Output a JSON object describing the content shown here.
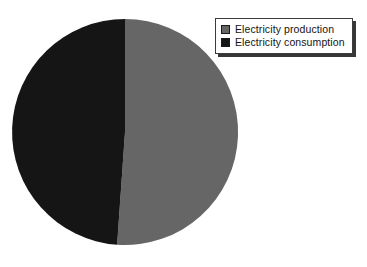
{
  "chart_data": {
    "type": "pie",
    "title": "",
    "subtitle": "",
    "xlabel": "",
    "ylabel": "",
    "grid": false,
    "legend_position": "top-right",
    "categories": [
      "Electricity production",
      "Electricity consumption"
    ],
    "values": [
      51,
      49
    ],
    "slices": [
      {
        "label": "Electricity production",
        "value": 51,
        "percent": 51,
        "color": "#666666",
        "start_angle_deg": 0,
        "end_angle_deg": 184
      },
      {
        "label": "Electricity consumption",
        "value": 49,
        "percent": 49,
        "color": "#151515",
        "start_angle_deg": 184,
        "end_angle_deg": 360
      }
    ],
    "annotations": []
  },
  "legend": {
    "items": [
      {
        "label": "Electricity production",
        "color": "#666666"
      },
      {
        "label": "Electricity consumption",
        "color": "#151515"
      }
    ]
  },
  "colors": {
    "production": "#666666",
    "consumption": "#151515",
    "background": "#ffffff",
    "legend_border": "#3c3c3c",
    "text": "#141414"
  },
  "geometry": {
    "center_x": 125,
    "center_y": 132,
    "radius": 113
  }
}
